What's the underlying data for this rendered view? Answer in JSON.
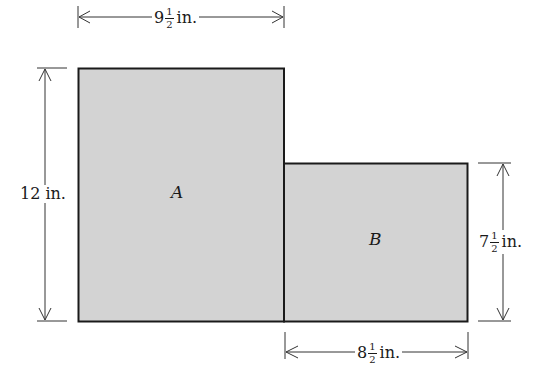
{
  "diagram": {
    "type": "composite-rectangle-area",
    "fill_color": "#d3d3d3",
    "stroke_color": "#1a1a1a",
    "regions": [
      {
        "id": "A",
        "label": "A",
        "width": "9 1/2 in.",
        "height": "12 in."
      },
      {
        "id": "B",
        "label": "B",
        "width": "8 1/2 in.",
        "height": "7 1/2 in."
      }
    ],
    "dimensions": {
      "top": {
        "whole": "9",
        "num": "1",
        "den": "2",
        "unit": "in."
      },
      "left": {
        "text": "12 in."
      },
      "right": {
        "whole": "7",
        "num": "1",
        "den": "2",
        "unit": "in."
      },
      "bottom": {
        "whole": "8",
        "num": "1",
        "den": "2",
        "unit": "in."
      }
    }
  }
}
